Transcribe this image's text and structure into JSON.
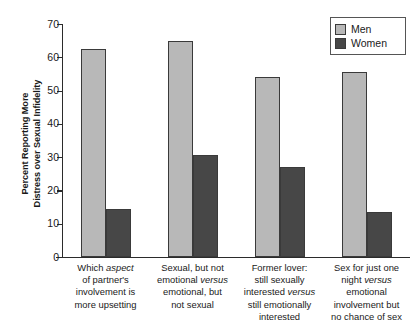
{
  "chart_data": {
    "type": "bar",
    "title": "",
    "xlabel": "",
    "ylabel": "Percent Reporting More Distress over Sexual Infidelity",
    "ylim": [
      0,
      70
    ],
    "yticks": [
      0,
      10,
      20,
      30,
      40,
      50,
      60,
      70
    ],
    "grid": false,
    "legend_position": "top-right",
    "categories": [
      "Which aspect of partner's involvement is more upsetting",
      "Sexual, but not emotional versus emotional, but not sexual",
      "Former lover: still sexually interested versus still emotionally interested",
      "Sex for just one night versus emotional involvement but no chance of sex"
    ],
    "series": [
      {
        "name": "Men",
        "color": "#b8b8b8",
        "values": [
          62.5,
          65.0,
          54.0,
          55.5
        ]
      },
      {
        "name": "Women",
        "color": "#474747",
        "values": [
          14.5,
          30.5,
          27.0,
          13.5
        ]
      }
    ]
  },
  "axis": {
    "y_title_line1": "Percent Reporting More",
    "y_title_line2": "Distress over Sexual Infidelity",
    "tick_labels": [
      "70",
      "60",
      "50",
      "40",
      "30",
      "20",
      "10",
      "0"
    ]
  },
  "legend": {
    "items": [
      {
        "label": "Men",
        "swatch": "men-swatch"
      },
      {
        "label": "Women",
        "swatch": "women-swatch"
      }
    ]
  },
  "x_labels": [
    {
      "lines": [
        [
          {
            "t": "Which ",
            "i": false
          },
          {
            "t": "aspect",
            "i": true
          }
        ],
        [
          {
            "t": "of partner's",
            "i": false
          }
        ],
        [
          {
            "t": "involvement is",
            "i": false
          }
        ],
        [
          {
            "t": "more upsetting",
            "i": false
          }
        ]
      ]
    },
    {
      "lines": [
        [
          {
            "t": "Sexual, but not",
            "i": false
          }
        ],
        [
          {
            "t": "emotional ",
            "i": false
          },
          {
            "t": "versus",
            "i": true
          }
        ],
        [
          {
            "t": "emotional, but",
            "i": false
          }
        ],
        [
          {
            "t": "not sexual",
            "i": false
          }
        ]
      ]
    },
    {
      "lines": [
        [
          {
            "t": "Former lover:",
            "i": false
          }
        ],
        [
          {
            "t": "still sexually",
            "i": false
          }
        ],
        [
          {
            "t": "interested ",
            "i": false
          },
          {
            "t": "versus",
            "i": true
          }
        ],
        [
          {
            "t": "still emotionally",
            "i": false
          }
        ],
        [
          {
            "t": "interested",
            "i": false
          }
        ]
      ]
    },
    {
      "lines": [
        [
          {
            "t": "Sex for just one",
            "i": false
          }
        ],
        [
          {
            "t": "night ",
            "i": false
          },
          {
            "t": "versus",
            "i": true
          }
        ],
        [
          {
            "t": "emotional",
            "i": false
          }
        ],
        [
          {
            "t": "involvement but",
            "i": false
          }
        ],
        [
          {
            "t": "no chance of sex",
            "i": false
          }
        ]
      ]
    }
  ]
}
